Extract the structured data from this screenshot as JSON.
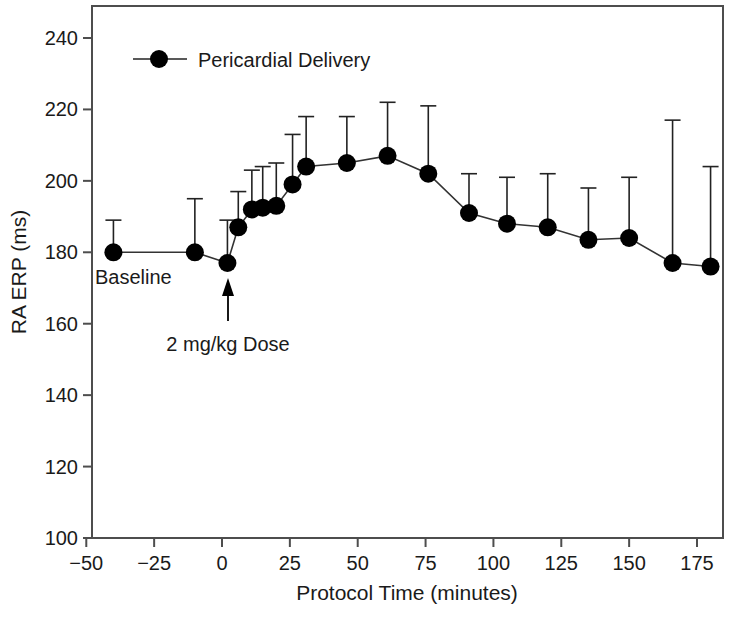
{
  "chart_data": {
    "type": "line",
    "title": "",
    "xlabel": "Protocol Time (minutes)",
    "ylabel": "RA ERP (ms)",
    "xlim": [
      -50,
      182
    ],
    "ylim": [
      100,
      248
    ],
    "xticks": [
      -50,
      -25,
      0,
      25,
      50,
      75,
      100,
      125,
      150,
      175
    ],
    "xtick_labels": [
      "−50",
      "−25",
      "0",
      "25",
      "50",
      "75",
      "100",
      "125",
      "150",
      "175"
    ],
    "yticks": [
      100,
      120,
      140,
      160,
      180,
      200,
      220,
      240
    ],
    "ytick_labels": [
      "100",
      "120",
      "140",
      "160",
      "180",
      "200",
      "220",
      "240"
    ],
    "grid": false,
    "legend_position": "top-left",
    "legend": [
      "Pericardial Delivery"
    ],
    "series": [
      {
        "name": "Pericardial Delivery",
        "marker": "filled-circle",
        "color": "#000000",
        "x": [
          -40,
          -10,
          2,
          6,
          11,
          15,
          20,
          26,
          31,
          46,
          61,
          76,
          91,
          105,
          120,
          135,
          150,
          166,
          180
        ],
        "values": [
          180,
          180,
          177,
          187,
          192,
          192.5,
          193,
          199,
          204,
          205,
          207,
          202,
          191,
          188,
          187,
          183.5,
          184,
          177,
          176
        ],
        "error_upper": [
          189,
          195,
          189,
          197,
          203,
          204,
          205,
          213,
          218,
          218,
          222,
          221,
          202,
          201,
          202,
          198,
          201,
          217,
          204
        ]
      }
    ],
    "annotations": [
      {
        "text": "Baseline",
        "x": -45,
        "y": 172
      },
      {
        "text": "2 mg/kg Dose",
        "x": 3,
        "y": 148,
        "arrow_to_x": 3,
        "arrow_to_y": 172
      }
    ]
  },
  "axes": {
    "x_title": "Protocol Time (minutes)",
    "y_title": "RA ERP (ms)"
  },
  "legend": {
    "entries": [
      {
        "label": "Pericardial Delivery"
      }
    ]
  },
  "annotations": {
    "baseline": "Baseline",
    "dose": "2 mg/kg Dose"
  },
  "colors": {
    "marker": "#000000",
    "line": "#333333",
    "frame": "#4d4d4d",
    "text": "#1a1a1a",
    "background": "#ffffff"
  }
}
